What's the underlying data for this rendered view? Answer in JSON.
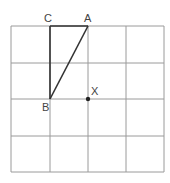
{
  "diagram": {
    "type": "grid-geometry",
    "grid": {
      "columns": 4,
      "rows": 4,
      "x_lines": [
        11,
        50,
        88,
        126,
        164
      ],
      "y_lines": [
        26,
        63,
        99,
        136,
        172
      ],
      "line_color": "#9a9a9a"
    },
    "points": [
      {
        "label": "A",
        "x": 88,
        "y": 26,
        "label_dx": -4,
        "label_dy": -4
      },
      {
        "label": "B",
        "x": 50,
        "y": 99,
        "label_dx": -8,
        "label_dy": 12
      },
      {
        "label": "C",
        "x": 50,
        "y": 26,
        "label_dx": -6,
        "label_dy": -4
      },
      {
        "label": "X",
        "x": 88,
        "y": 99,
        "label_dx": 3,
        "label_dy": -4,
        "marked": true
      }
    ],
    "segments": [
      {
        "from": "C",
        "to": "A"
      },
      {
        "from": "C",
        "to": "B"
      },
      {
        "from": "B",
        "to": "A"
      }
    ],
    "segment_color": "#333333"
  }
}
